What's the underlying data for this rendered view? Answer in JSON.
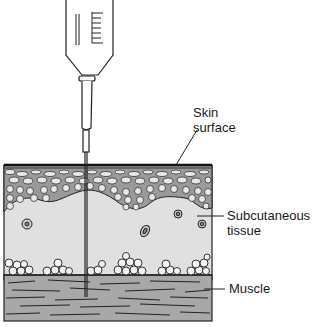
{
  "diagram": {
    "type": "anatomical cross-section",
    "labels": {
      "skin_surface_line1": "Skin",
      "skin_surface_line2": "surface",
      "subcutaneous_line1": "Subcutaneous",
      "subcutaneous_line2": "tissue",
      "muscle": "Muscle"
    },
    "layers": [
      {
        "name": "skin surface (epidermis)",
        "color": "#6e6e6e"
      },
      {
        "name": "subcutaneous tissue",
        "color": "#e0e0e0"
      },
      {
        "name": "fat globules",
        "color": "#f2f2f2"
      },
      {
        "name": "muscle",
        "color": "#a8a8a8"
      }
    ],
    "instrument": "syringe with needle inserted through skin into subcutaneous tissue reaching muscle"
  }
}
